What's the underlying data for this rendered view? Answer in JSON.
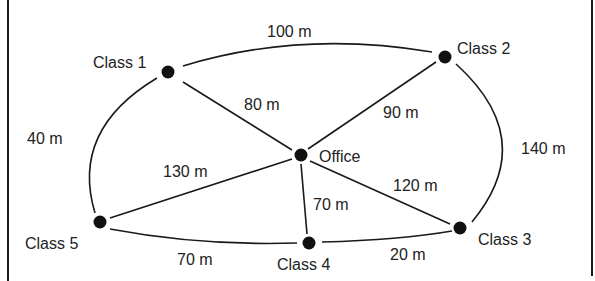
{
  "diagram": {
    "type": "network-graph",
    "nodes": [
      {
        "id": "class1",
        "label": "Class 1"
      },
      {
        "id": "class2",
        "label": "Class 2"
      },
      {
        "id": "office",
        "label": "Office"
      },
      {
        "id": "class3",
        "label": "Class 3"
      },
      {
        "id": "class4",
        "label": "Class 4"
      },
      {
        "id": "class5",
        "label": "Class 5"
      }
    ],
    "edges": [
      {
        "from": "class1",
        "to": "class2",
        "label": "100 m"
      },
      {
        "from": "class1",
        "to": "office",
        "label": "80 m"
      },
      {
        "from": "class2",
        "to": "office",
        "label": "90 m"
      },
      {
        "from": "class1",
        "to": "class5",
        "label": "40 m"
      },
      {
        "from": "class2",
        "to": "class3",
        "label": "140 m"
      },
      {
        "from": "office",
        "to": "class5",
        "label": "130 m"
      },
      {
        "from": "office",
        "to": "class3",
        "label": "120 m"
      },
      {
        "from": "office",
        "to": "class4",
        "label": "70 m"
      },
      {
        "from": "class5",
        "to": "class4",
        "label": "70 m"
      },
      {
        "from": "class4",
        "to": "class3",
        "label": "20 m"
      }
    ]
  }
}
